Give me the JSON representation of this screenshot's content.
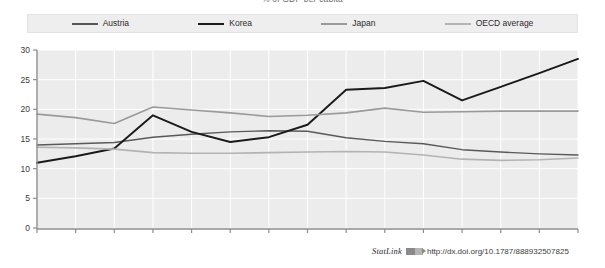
{
  "figure": {
    "title": "% of GDP per capita",
    "statlink": {
      "word": "StatLink",
      "glyph": "statlink-arrow-icon",
      "url": "http://dx.doi.org/10.1787/888932507825"
    }
  },
  "chart_data": {
    "type": "line",
    "title": "% of GDP per capita",
    "xlabel": "",
    "ylabel": "",
    "x": [
      1995,
      1996,
      1997,
      1998,
      1999,
      2000,
      2001,
      2002,
      2003,
      2004,
      2005,
      2006,
      2007,
      2008,
      2009
    ],
    "categories": [
      "1995",
      "1996",
      "1997",
      "1998",
      "1999",
      "2000",
      "2001",
      "2002",
      "2003",
      "2004",
      "2005",
      "2006",
      "2007",
      "2008",
      "2009"
    ],
    "xlim": [
      1995,
      2009
    ],
    "ylim": [
      0,
      30
    ],
    "yticks": [
      0,
      5,
      10,
      15,
      20,
      25,
      30
    ],
    "ytick_labels": [
      "0",
      "5",
      "10",
      "15",
      "20",
      "25",
      "30"
    ],
    "grid": true,
    "legend_position": "top",
    "series": [
      {
        "name": "Austria",
        "color": "#595959",
        "width": 1.4,
        "values": [
          14.0,
          14.2,
          14.4,
          15.3,
          15.8,
          16.2,
          16.4,
          16.3,
          15.2,
          14.6,
          14.2,
          13.2,
          12.8,
          12.5,
          12.3
        ]
      },
      {
        "name": "Korea",
        "color": "#1a1a1a",
        "width": 1.9,
        "values": [
          11.0,
          12.1,
          13.4,
          19.0,
          16.2,
          14.5,
          15.3,
          17.4,
          23.3,
          23.6,
          24.8,
          21.5,
          23.8,
          26.1,
          28.5
        ]
      },
      {
        "name": "Japan",
        "color": "#9a9a9a",
        "width": 1.6,
        "values": [
          19.2,
          18.6,
          17.6,
          20.4,
          19.9,
          19.4,
          18.8,
          19.0,
          19.4,
          20.2,
          19.5,
          19.6,
          19.7,
          19.7,
          19.7
        ]
      },
      {
        "name": "OECD average",
        "color": "#b3b3b3",
        "width": 1.6,
        "values": [
          13.6,
          13.5,
          13.3,
          12.7,
          12.6,
          12.6,
          12.7,
          12.8,
          12.9,
          12.8,
          12.3,
          11.6,
          11.4,
          11.5,
          11.8
        ]
      }
    ]
  }
}
